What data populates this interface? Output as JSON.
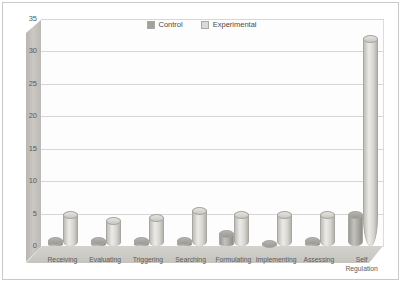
{
  "chart_data": {
    "type": "bar",
    "title": "",
    "xlabel": "",
    "ylabel": "",
    "ylim": [
      0,
      35
    ],
    "yticks": [
      0,
      5,
      10,
      15,
      20,
      25,
      30,
      35
    ],
    "grid": true,
    "legend_position": "top-center",
    "style": "3d-cylinder-column",
    "categories": [
      "Receiving",
      "Evaluating",
      "Triggering",
      "Searching",
      "Formulating",
      "Implementing",
      "Assessing",
      "Self Regulation"
    ],
    "series": [
      {
        "name": "Control",
        "color": "#a3a19c",
        "values": [
          1,
          1,
          1,
          1,
          2,
          0.5,
          1,
          5
        ]
      },
      {
        "name": "Experimental",
        "color": "#dcdad5",
        "values": [
          5,
          4,
          4.5,
          5.5,
          5,
          5,
          5,
          32
        ]
      }
    ]
  },
  "legend": {
    "items": [
      {
        "label": "Control"
      },
      {
        "label": "Experimental"
      }
    ]
  },
  "axis": {
    "y_tick_labels": [
      "35",
      "30",
      "25",
      "20",
      "15",
      "10",
      "5",
      "0"
    ]
  },
  "xaxis": {
    "labels": [
      {
        "line1": "Receiving",
        "line2": ""
      },
      {
        "line1": "Evaluating",
        "line2": ""
      },
      {
        "line1": "Triggering",
        "line2": ""
      },
      {
        "line1": "Searching",
        "line2": ""
      },
      {
        "line1": "Formulating",
        "line2": ""
      },
      {
        "line1": "Implementing",
        "line2": ""
      },
      {
        "line1": "Assessing",
        "line2": ""
      },
      {
        "line1": "Self",
        "line2": "Regulation"
      }
    ]
  }
}
